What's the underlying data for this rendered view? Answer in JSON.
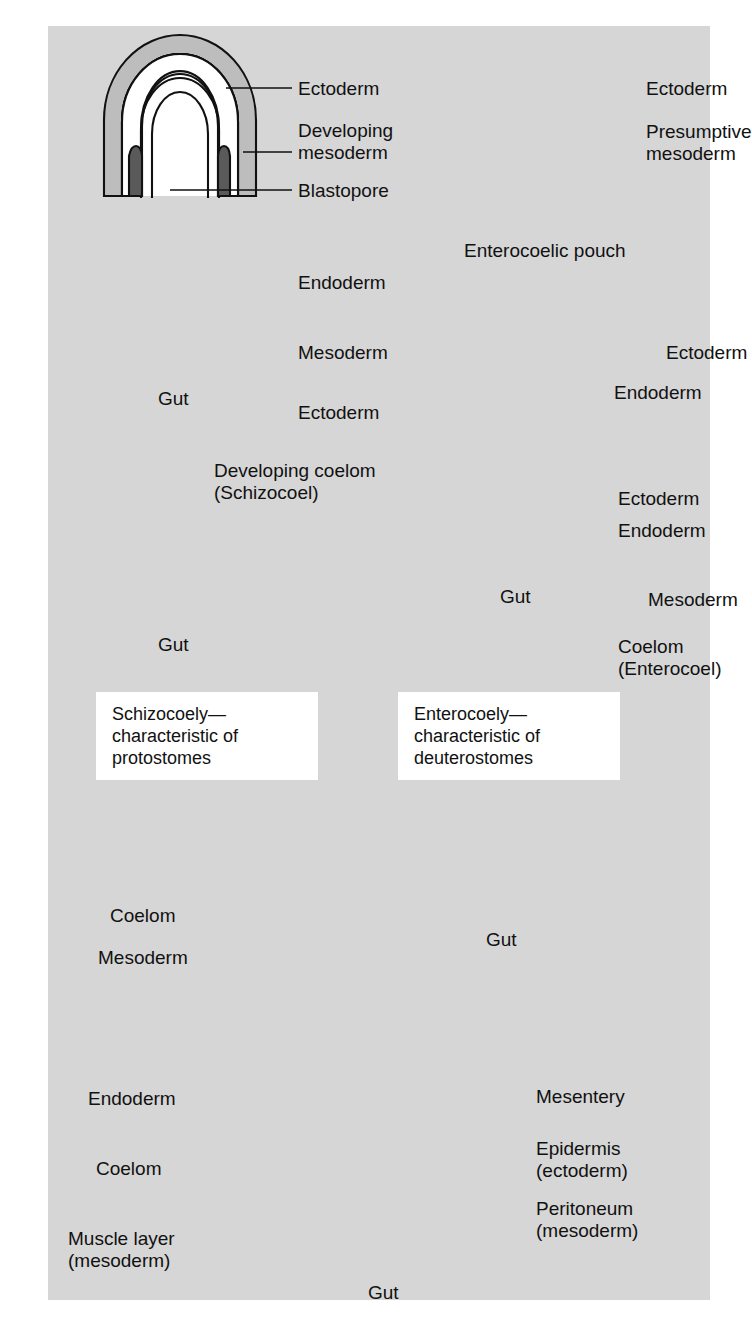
{
  "figure": {
    "type": "biology-diagram",
    "background_color": "#d6d6d6",
    "ink_color": "#111111",
    "fills": {
      "ectoderm": "#bdbdbd",
      "endoderm": "#d4d4d4",
      "mesoderm_dark": "#5a5a5a",
      "cavity_white": "#ffffff"
    }
  },
  "stages": {
    "row1_left": {
      "name": "protostome-gastrula",
      "labels": [
        "Ectoderm",
        "Developing",
        "mesoderm",
        "Blastopore"
      ]
    },
    "row1_right": {
      "name": "deuterostome-gastrula",
      "labels": [
        "Ectoderm",
        "Presumptive",
        "mesoderm"
      ]
    },
    "row2_left": {
      "name": "protostome-cross-section",
      "labels": [
        "Endoderm",
        "Mesoderm",
        "Ectoderm",
        "Gut"
      ]
    },
    "row2_right": {
      "name": "deuterostome-cross-section",
      "labels": [
        "Enterocoelic pouch",
        "Ectoderm",
        "Endoderm"
      ]
    },
    "row3_left": {
      "name": "schizocoel-cross-section",
      "labels": [
        "Developing coelom",
        "(Schizocoel)",
        "Gut"
      ]
    },
    "row3_right": {
      "name": "enterocoel-cross-section",
      "labels": [
        "Ectoderm",
        "Endoderm",
        "Mesoderm",
        "Coelom",
        "(Enterocoel)",
        "Gut"
      ]
    },
    "row5_middle": {
      "name": "generalized-coelomate",
      "labels": [
        "Coelom",
        "Mesoderm",
        "Gut"
      ]
    },
    "row6_bottom": {
      "name": "mature-coelomate-body-plan",
      "labels": [
        "Endoderm",
        "Coelom",
        "Muscle layer",
        "(mesoderm)",
        "Mesentery",
        "Epidermis",
        "(ectoderm)",
        "Peritoneum",
        "(mesoderm)",
        "Gut"
      ]
    }
  },
  "callouts": {
    "r1l_ectoderm": "Ectoderm",
    "r1l_dev": "Developing",
    "r1l_meso": "mesoderm",
    "r1l_blasto": "Blastopore",
    "r1r_ectoderm": "Ectoderm",
    "r1r_presump": "Presumptive",
    "r1r_meso": "mesoderm",
    "r2l_endoderm": "Endoderm",
    "r2l_mesoderm": "Mesoderm",
    "r2l_ectoderm": "Ectoderm",
    "r2l_gut": "Gut",
    "r2r_pouch": "Enterocoelic pouch",
    "r2r_ectoderm": "Ectoderm",
    "r2r_endoderm": "Endoderm",
    "r3l_devcoelom": "Developing coelom",
    "r3l_schizo": "(Schizocoel)",
    "r3l_gut": "Gut",
    "r3r_ectoderm": "Ectoderm",
    "r3r_endoderm": "Endoderm",
    "r3r_mesoderm": "Mesoderm",
    "r3r_coelom": "Coelom",
    "r3r_entero": "(Enterocoel)",
    "r3r_gut": "Gut",
    "mid_coelom": "Coelom",
    "mid_mesoderm": "Mesoderm",
    "mid_gut": "Gut",
    "bot_endoderm": "Endoderm",
    "bot_coelom": "Coelom",
    "bot_muscle": "Muscle layer",
    "bot_muscle2": "(mesoderm)",
    "bot_mesentery": "Mesentery",
    "bot_epidermis": "Epidermis",
    "bot_epidermis2": "(ectoderm)",
    "bot_peritoneum": "Peritoneum",
    "bot_peritoneum2": "(mesoderm)",
    "bot_gut": "Gut"
  },
  "caption_boxes": [
    {
      "id": "schizocoely-box",
      "lines": [
        "Schizocoely—",
        "characteristic of",
        "protostomes"
      ]
    },
    {
      "id": "enterocoely-box",
      "lines": [
        "Enterocoely—",
        "characteristic of",
        "deuterostomes"
      ]
    }
  ]
}
